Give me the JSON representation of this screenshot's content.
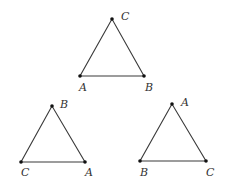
{
  "triangles": [
    {
      "name": "top",
      "vertices": [
        {
          "label": "C",
          "x": 112,
          "y": 19,
          "lx": 121,
          "ly": 20
        },
        {
          "label": "A",
          "x": 80,
          "y": 76,
          "lx": 79,
          "ly": 91
        },
        {
          "label": "B",
          "x": 144,
          "y": 76,
          "lx": 145,
          "ly": 91
        }
      ]
    },
    {
      "name": "bottom-left",
      "vertices": [
        {
          "label": "B",
          "x": 52,
          "y": 106,
          "lx": 60,
          "ly": 108
        },
        {
          "label": "C",
          "x": 21,
          "y": 162,
          "lx": 21,
          "ly": 176
        },
        {
          "label": "A",
          "x": 85,
          "y": 162,
          "lx": 85,
          "ly": 176
        }
      ]
    },
    {
      "name": "bottom-right",
      "vertices": [
        {
          "label": "A",
          "x": 172,
          "y": 104,
          "lx": 181,
          "ly": 106
        },
        {
          "label": "B",
          "x": 140,
          "y": 161,
          "lx": 140,
          "ly": 176
        },
        {
          "label": "C",
          "x": 206,
          "y": 161,
          "lx": 206,
          "ly": 176
        }
      ]
    }
  ]
}
